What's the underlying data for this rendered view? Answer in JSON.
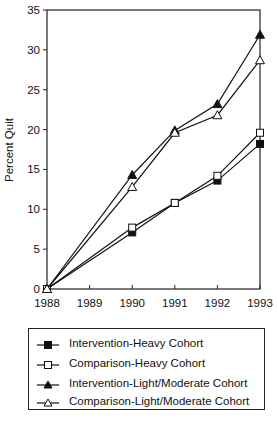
{
  "chart_data": {
    "type": "line",
    "title": "",
    "xlabel": "",
    "ylabel": "Percent Quit",
    "x": [
      1988,
      1989,
      1990,
      1991,
      1992,
      1993
    ],
    "x_tick_labels": [
      "1988",
      "1989",
      "1990",
      "1991",
      "1992",
      "1993"
    ],
    "y_tick_labels": [
      "0",
      "5",
      "10",
      "15",
      "20",
      "25",
      "30",
      "35"
    ],
    "ylim": [
      0,
      35
    ],
    "xlim": [
      1988,
      1993
    ],
    "grid": false,
    "legend_position": "below",
    "series": [
      {
        "name": "Intervention-Heavy Cohort",
        "marker": "filled-square",
        "x": [
          1988,
          1990,
          1991,
          1992,
          1993
        ],
        "values": [
          0,
          7.1,
          10.8,
          13.6,
          18.2
        ]
      },
      {
        "name": "Comparison-Heavy Cohort",
        "marker": "open-square",
        "x": [
          1988,
          1990,
          1991,
          1992,
          1993
        ],
        "values": [
          0,
          7.7,
          10.8,
          14.2,
          19.6
        ]
      },
      {
        "name": "Intervention-Light/Moderate Cohort",
        "marker": "filled-triangle",
        "x": [
          1988,
          1990,
          1991,
          1992,
          1993
        ],
        "values": [
          0,
          14.3,
          19.9,
          23.2,
          31.9
        ]
      },
      {
        "name": "Comparison-Light/Moderate Cohort",
        "marker": "open-triangle",
        "x": [
          1988,
          1990,
          1991,
          1992,
          1993
        ],
        "values": [
          0,
          12.8,
          19.6,
          21.8,
          28.7
        ]
      }
    ]
  },
  "legend": {
    "items": [
      {
        "label": "Intervention-Heavy Cohort"
      },
      {
        "label": "Comparison-Heavy Cohort"
      },
      {
        "label": "Intervention-Light/Moderate Cohort"
      },
      {
        "label": "Comparison-Light/Moderate Cohort"
      }
    ]
  },
  "axis": {
    "ylabel": "Percent Quit"
  }
}
